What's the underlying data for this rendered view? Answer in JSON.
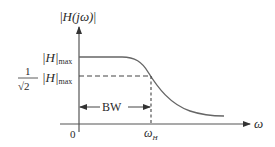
{
  "diagram": {
    "y_axis_label": {
      "prefix": "|",
      "main": "H(jω)",
      "suffix": "|"
    },
    "x_axis_label": "ω",
    "origin_label": "0",
    "max_label": {
      "main": "|H|",
      "sub": "max"
    },
    "half_power_label": {
      "num": "1",
      "den": "√2",
      "main": "|H|",
      "sub": "max"
    },
    "cutoff_label": {
      "main": "ω",
      "sub": "H"
    },
    "bandwidth_label": "BW",
    "colors": {
      "line": "#555555",
      "text": "#2a2a2a",
      "background": "#ffffff"
    }
  }
}
